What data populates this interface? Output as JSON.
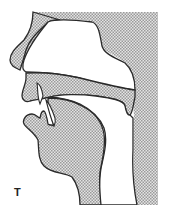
{
  "figure": {
    "label": "T",
    "colors": {
      "outline": "#2a2a2a",
      "fill": "#c8c8c8",
      "background": "#ffffff"
    },
    "parts": [
      "nose",
      "hard-palate",
      "upper-lip",
      "upper-teeth",
      "lower-lip",
      "lower-teeth",
      "tongue",
      "velum",
      "pharynx-wall"
    ]
  }
}
